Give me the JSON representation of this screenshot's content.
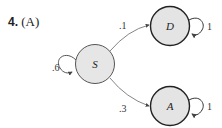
{
  "title": {
    "number": "4.",
    "option": "(A)"
  },
  "diagram": {
    "type": "state-transition",
    "colors": {
      "node_fill": "#e4e4e4",
      "node_stroke": "#333333",
      "edge": "#555555"
    },
    "nodes": [
      {
        "id": "S",
        "label": "S"
      },
      {
        "id": "D",
        "label": "D"
      },
      {
        "id": "A",
        "label": "A"
      }
    ],
    "edges": [
      {
        "from": "S",
        "to": "S",
        "label": ".6"
      },
      {
        "from": "S",
        "to": "D",
        "label": ".1"
      },
      {
        "from": "S",
        "to": "A",
        "label": ".3"
      },
      {
        "from": "D",
        "to": "D",
        "label": "1"
      },
      {
        "from": "A",
        "to": "A",
        "label": "1"
      }
    ]
  }
}
